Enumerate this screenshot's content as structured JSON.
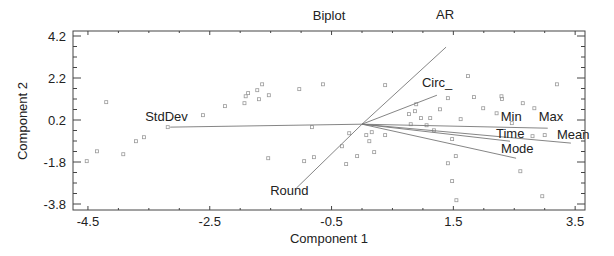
{
  "chart_data": {
    "type": "scatter",
    "subtype": "biplot",
    "title": "Biplot",
    "xlabel": "Component 1",
    "ylabel": "Component 2",
    "xlim": [
      -4.75,
      3.7
    ],
    "ylim": [
      -4.05,
      4.5
    ],
    "x_ticks": [
      -4.5,
      -2.5,
      -0.5,
      1.5,
      3.5
    ],
    "x_tick_labels": [
      "-4.5",
      "-2.5",
      "-0.5",
      "1.5",
      "3.5"
    ],
    "y_ticks": [
      4.2,
      2.2,
      0.2,
      -1.8,
      -3.8
    ],
    "y_tick_labels": [
      "4.2",
      "2.2",
      "0.2",
      "-1.8",
      "-3.8"
    ],
    "minor_tick_step": 0.5,
    "grid": false,
    "legend": null,
    "vectors": [
      {
        "name": "AR",
        "x": 1.38,
        "y": 3.67
      },
      {
        "name": "Circ_",
        "x": 1.23,
        "y": 1.38
      },
      {
        "name": "StdDev",
        "x": -3.15,
        "y": -0.14
      },
      {
        "name": "Min",
        "x": 3.0,
        "y": -0.18
      },
      {
        "name": "Max",
        "x": 3.05,
        "y": -0.19
      },
      {
        "name": "Mean",
        "x": 3.43,
        "y": -0.9
      },
      {
        "name": "Time",
        "x": 2.43,
        "y": -0.81
      },
      {
        "name": "Mode",
        "x": 2.53,
        "y": -1.62
      },
      {
        "name": "Round",
        "x": -1.08,
        "y": -3.05
      }
    ],
    "points": [
      {
        "x": -4.52,
        "y": -1.76
      },
      {
        "x": -4.35,
        "y": -1.29
      },
      {
        "x": -4.2,
        "y": 1.05
      },
      {
        "x": -3.92,
        "y": -1.43
      },
      {
        "x": -3.71,
        "y": -0.81
      },
      {
        "x": -3.58,
        "y": -0.62
      },
      {
        "x": -3.19,
        "y": -0.14
      },
      {
        "x": -2.61,
        "y": 0.43
      },
      {
        "x": -2.25,
        "y": 0.86
      },
      {
        "x": -1.93,
        "y": 1.0
      },
      {
        "x": -1.91,
        "y": 1.33
      },
      {
        "x": -1.87,
        "y": 1.48
      },
      {
        "x": -1.72,
        "y": 1.62
      },
      {
        "x": -1.69,
        "y": 1.19
      },
      {
        "x": -1.64,
        "y": 1.9
      },
      {
        "x": -1.53,
        "y": 1.38
      },
      {
        "x": -1.03,
        "y": 1.67
      },
      {
        "x": -0.64,
        "y": 1.9
      },
      {
        "x": -0.82,
        "y": -0.14
      },
      {
        "x": -1.54,
        "y": -1.62
      },
      {
        "x": -0.95,
        "y": -1.76
      },
      {
        "x": -0.79,
        "y": -1.57
      },
      {
        "x": -0.33,
        "y": -1.05
      },
      {
        "x": -0.21,
        "y": -0.43
      },
      {
        "x": -0.08,
        "y": -1.52
      },
      {
        "x": -0.26,
        "y": -1.9
      },
      {
        "x": 0.07,
        "y": -0.52
      },
      {
        "x": 0.12,
        "y": -0.81
      },
      {
        "x": 0.16,
        "y": -0.38
      },
      {
        "x": 0.38,
        "y": -0.52
      },
      {
        "x": 0.38,
        "y": 1.86
      },
      {
        "x": 0.2,
        "y": -1.33
      },
      {
        "x": 1.06,
        "y": -0.05
      },
      {
        "x": 0.8,
        "y": 0.0
      },
      {
        "x": 0.89,
        "y": 0.95
      },
      {
        "x": 0.77,
        "y": 0.48
      },
      {
        "x": 0.87,
        "y": 0.62
      },
      {
        "x": 0.97,
        "y": 0.29
      },
      {
        "x": 1.12,
        "y": 0.29
      },
      {
        "x": 1.28,
        "y": 0.71
      },
      {
        "x": 1.41,
        "y": 1.24
      },
      {
        "x": 1.62,
        "y": 0.24
      },
      {
        "x": 1.18,
        "y": -0.29
      },
      {
        "x": 1.48,
        "y": -0.71
      },
      {
        "x": 1.54,
        "y": -1.52
      },
      {
        "x": 1.41,
        "y": -1.86
      },
      {
        "x": 1.48,
        "y": -2.71
      },
      {
        "x": 1.55,
        "y": -3.62
      },
      {
        "x": 1.74,
        "y": 2.29
      },
      {
        "x": 1.84,
        "y": 1.29
      },
      {
        "x": 2.29,
        "y": 1.33
      },
      {
        "x": 2.3,
        "y": 1.2
      },
      {
        "x": 2.64,
        "y": 1.0
      },
      {
        "x": 2.21,
        "y": 0.52
      },
      {
        "x": 1.99,
        "y": 0.76
      },
      {
        "x": 2.46,
        "y": 0.05
      },
      {
        "x": 2.83,
        "y": 0.76
      },
      {
        "x": 3.2,
        "y": 1.9
      },
      {
        "x": 2.8,
        "y": -0.57
      },
      {
        "x": 2.6,
        "y": -2.24
      },
      {
        "x": 2.96,
        "y": -3.43
      },
      {
        "x": 3.0,
        "y": -0.52
      }
    ]
  },
  "colors": {
    "axis": "#444444",
    "vector": "#777777",
    "point": "#9a9a9a",
    "text": "#222222",
    "background": "#ffffff"
  }
}
